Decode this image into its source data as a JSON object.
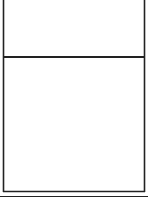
{
  "diagram": {
    "type": "go-board-fragments",
    "colors": {
      "line": "#222222",
      "grid": "#3a3a3a",
      "stone": "#111111",
      "background": "#ffffff"
    },
    "panels": [
      {
        "name": "top-board",
        "stones": [
          {
            "x": 25,
            "y": 23,
            "color": "black"
          },
          {
            "x": 37,
            "y": 10,
            "color": "black"
          },
          {
            "x": 49,
            "y": -1,
            "color": "black"
          },
          {
            "x": 85,
            "y": -1,
            "color": "black"
          },
          {
            "x": 85,
            "y": 11,
            "color": "black"
          },
          {
            "x": 85,
            "y": 23,
            "color": "black"
          },
          {
            "x": 49,
            "y": 35,
            "color": "black"
          },
          {
            "x": 49,
            "y": 47,
            "color": "black"
          }
        ],
        "connector": [
          [
            25,
            23
          ],
          [
            37,
            10
          ],
          [
            49,
            -1
          ]
        ]
      },
      {
        "name": "bottom-board",
        "stones": [
          {
            "x": 121,
            "y": 110,
            "color": "black"
          },
          {
            "x": 97,
            "y": 122,
            "color": "black"
          },
          {
            "x": 13,
            "y": 158,
            "color": "black"
          },
          {
            "x": 85,
            "y": 170,
            "color": "black"
          }
        ],
        "marked_stone": {
          "x": 37,
          "y": 135,
          "marker": "x-star"
        }
      }
    ]
  }
}
